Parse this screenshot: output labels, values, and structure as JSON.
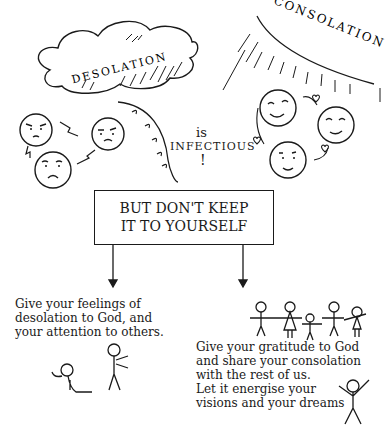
{
  "diagram": {
    "desolation_label": "DESOLATION",
    "consolation_label": "CONSOLATION",
    "connector_is": "is",
    "connector_infectious": "INFECTIOUS",
    "connector_exclaim": "!",
    "center_box": {
      "line1": "BUT DON'T KEEP",
      "line2": "IT TO YOURSELF"
    },
    "left_branch": {
      "lines": [
        "Give your feelings of",
        "desolation to God, and",
        "your attention to others."
      ]
    },
    "right_branch": {
      "lines": [
        "Give your gratitude to God",
        "and share your consolation",
        "with the rest of us.",
        "Let it energise your",
        "visions and your dreams"
      ]
    },
    "icons": {
      "desolation": "storm-cloud-icon",
      "consolation": "sun-rays-icon",
      "sad_faces": [
        "sad-face-icon",
        "sad-face-icon",
        "sad-face-icon"
      ],
      "happy_faces": [
        "happy-face-icon",
        "happy-face-icon",
        "happy-face-icon"
      ],
      "hearts": "heart-icon",
      "praying_figure": "kneeling-figure-icon",
      "turning_figure": "walking-figure-icon",
      "group_figures": "holding-hands-figures-icon",
      "joy_figure": "arms-raised-figure-icon"
    },
    "colors": {
      "ink": "#1a1a1a",
      "background": "#ffffff"
    }
  }
}
